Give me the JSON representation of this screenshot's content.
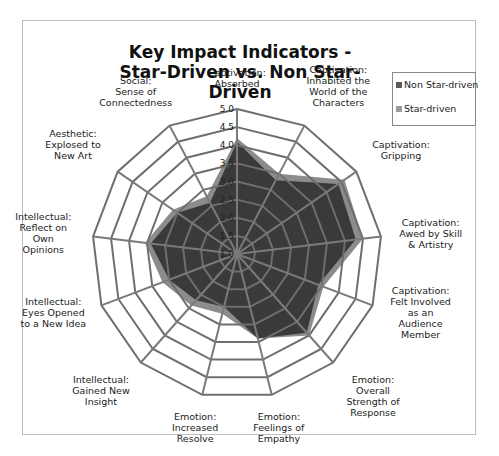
{
  "chart_data": {
    "type": "radar",
    "title": "Key Impact Indicators - Star-Driven vs. Non Star-Driven",
    "title_lines": [
      "Key Impact Indicators -",
      "Star-Driven vs. Non Star-Driven"
    ],
    "categories": [
      "Captivation: Absorbed",
      "Captivation: Inhabited the World of the Characters",
      "Captivation: Gripping",
      "Captivation: Awed by Skill & Artistry",
      "Captivation: Felt Involved as an Audience Member",
      "Emotion: Overall Strength of Response",
      "Emotion: Feelings of Empathy",
      "Emotion: Increased Resolve",
      "Intellectual: Gained New Insight",
      "Intellectual: Eyes Opened to a New Idea",
      "Intellectual: Reflect on Own Opinions",
      "Aesthetic: Explosed to New Art",
      "Social: Sense of Connectedness"
    ],
    "category_label_lines": [
      [
        "Captivation:",
        "Absorbed"
      ],
      [
        "Captivation:",
        "Inhabited the",
        "World of the",
        "Characters"
      ],
      [
        "Captivation:",
        "Gripping"
      ],
      [
        "Captivation:",
        "Awed by Skill",
        "& Artistry"
      ],
      [
        "Captivation:",
        "Felt Involved",
        "as an",
        "Audience",
        "Member"
      ],
      [
        "Emotion:",
        "Overall",
        "Strength of",
        "Response"
      ],
      [
        "Emotion:",
        "Feelings of",
        "Empathy"
      ],
      [
        "Emotion:",
        "Increased",
        "Resolve"
      ],
      [
        "Intellectual:",
        "Gained New",
        "Insight"
      ],
      [
        "Intellectual:",
        "Eyes Opened",
        "to a New Idea"
      ],
      [
        "Intellectual:",
        "Reflect on",
        "Own",
        "Opinions"
      ],
      [
        "Aesthetic:",
        "Explosed to",
        "New Art"
      ],
      [
        "Social:",
        "Sense of",
        "Connectedness"
      ]
    ],
    "series": [
      {
        "name": "Star-driven",
        "color": "#8c8c8c",
        "values": [
          4.2,
          3.5,
          4.6,
          4.5,
          3.55,
          4.0,
          3.4,
          2.7,
          2.9,
          3.2,
          3.55,
          3.15,
          2.8
        ]
      },
      {
        "name": "Non Star-driven",
        "color": "#3a3a3a",
        "values": [
          4.1,
          3.3,
          4.4,
          4.3,
          3.4,
          3.9,
          3.4,
          2.5,
          2.7,
          3.0,
          3.4,
          3.0,
          2.6
        ]
      }
    ],
    "rlim": [
      1.0,
      5.0
    ],
    "ticks": [
      "1.0",
      "1.5",
      "2.0",
      "2.5",
      "3.0",
      "3.5",
      "4.0",
      "4.5",
      "5.0"
    ],
    "legend": [
      "Non Star-driven",
      "Star-driven"
    ],
    "legend_position": "right",
    "grid": true
  },
  "legend": {
    "items": [
      {
        "label": "Non Star-driven",
        "color": "#5a5a5a"
      },
      {
        "label": "Star-driven",
        "color": "#9a9a9a"
      }
    ]
  }
}
